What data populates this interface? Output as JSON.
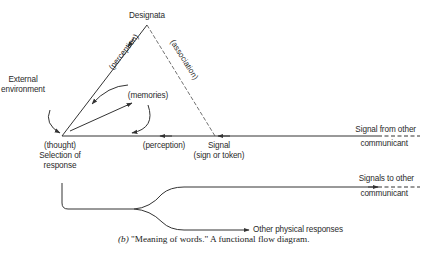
{
  "diagram": {
    "nodes": {
      "designata": "Designata",
      "external_environment_line1": "External",
      "external_environment_line2": "environment",
      "memories": "(memories)",
      "thought_line1": "(thought)",
      "thought_line2": "Selection of",
      "thought_line3": "response",
      "signal_line1": "Signal",
      "signal_line2": "(sign or token)",
      "signal_from_line1": "Signal from other",
      "signal_from_line2": "communicant",
      "signals_to_line1": "Signals to other",
      "signals_to_line2": "communicant",
      "other_physical": "Other physical responses"
    },
    "edges": {
      "perception_left": "(perception)",
      "association": "(association)",
      "perception_bottom": "(perception)"
    },
    "caption": {
      "prefix": "(b)",
      "text": " \"Meaning of words.\"  A functional flow diagram."
    }
  }
}
